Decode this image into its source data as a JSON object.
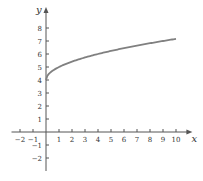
{
  "chart_data": {
    "type": "line",
    "title": "",
    "xlabel": "x",
    "ylabel": "y",
    "xlim": [
      -2.5,
      10.8
    ],
    "ylim": [
      -3,
      9
    ],
    "x_ticks": [
      -2,
      -1,
      1,
      2,
      3,
      4,
      5,
      6,
      7,
      8,
      9,
      10
    ],
    "y_ticks": [
      -2,
      -1,
      1,
      2,
      3,
      4,
      5,
      6,
      7,
      8
    ],
    "grid": false,
    "legend": null,
    "series": [
      {
        "name": "y = 4 + sqrt(x)",
        "color": "#808080",
        "x": [
          0,
          0.05,
          0.2,
          0.5,
          1,
          1.5,
          2,
          3,
          4,
          5,
          6,
          7,
          8,
          9,
          10
        ],
        "y": [
          4,
          4.22,
          4.45,
          4.71,
          5,
          5.22,
          5.41,
          5.73,
          6,
          6.24,
          6.45,
          6.65,
          6.83,
          7,
          7.16
        ]
      }
    ]
  },
  "colors": {
    "axis": "#555555",
    "curve": "#808080"
  }
}
